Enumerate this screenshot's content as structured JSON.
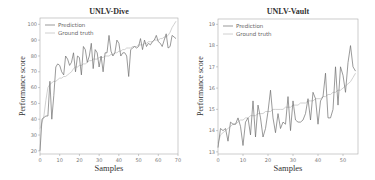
{
  "chart_data": [
    {
      "type": "line",
      "title": "UNLV-Dive",
      "xlabel": "Samples",
      "ylabel": "Performance score",
      "xlim": [
        0,
        70
      ],
      "ylim": [
        18,
        104
      ],
      "xticks": [
        0,
        10,
        20,
        30,
        40,
        50,
        60,
        70
      ],
      "yticks": [
        20,
        30,
        40,
        50,
        60,
        70,
        80,
        90,
        100
      ],
      "legend": {
        "position": "upper left",
        "entries": [
          "Prediction",
          "Ground truth"
        ]
      },
      "grid": false,
      "colors": {
        "prediction": "#6e6e6e",
        "ground_truth": "#c4c4c4"
      },
      "x": [
        0,
        1,
        2,
        3,
        4,
        5,
        6,
        7,
        8,
        9,
        10,
        11,
        12,
        13,
        14,
        15,
        16,
        17,
        18,
        19,
        20,
        21,
        22,
        23,
        24,
        25,
        26,
        27,
        28,
        29,
        30,
        31,
        32,
        33,
        34,
        35,
        36,
        37,
        38,
        39,
        40,
        41,
        42,
        43,
        44,
        45,
        46,
        47,
        48,
        49,
        50,
        51,
        52,
        53,
        54,
        55,
        56,
        57,
        58,
        59,
        60,
        61,
        62,
        63,
        64,
        65,
        66,
        67,
        68,
        69
      ],
      "series": [
        {
          "name": "Prediction",
          "values": [
            20,
            40,
            41,
            42,
            42,
            64,
            40,
            55,
            73,
            75,
            74,
            70,
            68,
            80,
            78,
            74,
            76,
            82,
            70,
            80,
            79,
            68,
            86,
            84,
            76,
            80,
            88,
            72,
            84,
            82,
            73,
            80,
            70,
            82,
            82,
            93,
            83,
            80,
            82,
            90,
            88,
            80,
            82,
            82,
            80,
            67,
            84,
            85,
            86,
            85,
            86,
            91,
            84,
            90,
            86,
            88,
            87,
            89,
            90,
            93,
            89,
            88,
            86,
            90,
            94,
            85,
            86,
            93,
            92,
            91
          ]
        },
        {
          "name": "Ground truth",
          "values": [
            34,
            38,
            42,
            52,
            60,
            62,
            63,
            64,
            64,
            65,
            66,
            66,
            67,
            67,
            68,
            69,
            70,
            72,
            73,
            73,
            74,
            74,
            75,
            75,
            76,
            77,
            77,
            78,
            78,
            78,
            79,
            79,
            79,
            80,
            80,
            80,
            81,
            81,
            82,
            82,
            83,
            83,
            84,
            84,
            85,
            85,
            85,
            86,
            86,
            86,
            87,
            87,
            87,
            88,
            88,
            89,
            89,
            89,
            90,
            90,
            90,
            91,
            91,
            92,
            92,
            93,
            95,
            98,
            100,
            102
          ]
        }
      ]
    },
    {
      "type": "line",
      "title": "UNLV-Vault",
      "xlabel": "Samples",
      "ylabel": "Performance score",
      "xlim": [
        0,
        56
      ],
      "ylim": [
        12.9,
        19.25
      ],
      "xticks": [
        0,
        10,
        20,
        30,
        40,
        50
      ],
      "yticks": [
        13,
        14,
        15,
        16,
        17,
        18,
        19
      ],
      "legend": {
        "position": "upper left",
        "entries": [
          "Prediction",
          "Ground truth"
        ]
      },
      "grid": false,
      "colors": {
        "prediction": "#6e6e6e",
        "ground_truth": "#c4c4c4"
      },
      "x": [
        0,
        1,
        2,
        3,
        4,
        5,
        6,
        7,
        8,
        9,
        10,
        11,
        12,
        13,
        14,
        15,
        16,
        17,
        18,
        19,
        20,
        21,
        22,
        23,
        24,
        25,
        26,
        27,
        28,
        29,
        30,
        31,
        32,
        33,
        34,
        35,
        36,
        37,
        38,
        39,
        40,
        41,
        42,
        43,
        44,
        45,
        46,
        47,
        48,
        49,
        50,
        51,
        52,
        53,
        54,
        55
      ],
      "series": [
        {
          "name": "Prediction",
          "values": [
            13.2,
            14.1,
            14.0,
            14.1,
            13.5,
            14.4,
            14.3,
            14.3,
            14.6,
            14.2,
            13.3,
            14.4,
            14.6,
            13.8,
            15.4,
            13.7,
            15.2,
            14.6,
            13.7,
            14.1,
            14.9,
            15.9,
            14.6,
            13.9,
            14.8,
            14.1,
            14.4,
            14.3,
            15.6,
            14.0,
            15.4,
            14.5,
            14.4,
            14.4,
            14.5,
            14.8,
            15.5,
            14.5,
            15.8,
            15.5,
            14.3,
            15.4,
            15.6,
            16.7,
            14.6,
            14.6,
            15.0,
            17.0,
            15.2,
            17.0,
            16.6,
            15.8,
            17.2,
            18.0,
            17.0,
            16.8
          ]
        },
        {
          "name": "Ground truth",
          "values": [
            13.4,
            13.8,
            13.9,
            14.0,
            14.1,
            14.2,
            14.3,
            14.3,
            14.4,
            14.5,
            14.5,
            14.6,
            14.6,
            14.7,
            14.7,
            14.7,
            14.8,
            14.8,
            14.8,
            14.9,
            14.9,
            14.9,
            15.0,
            15.0,
            15.0,
            15.0,
            15.0,
            15.1,
            15.1,
            15.1,
            15.2,
            15.2,
            15.2,
            15.3,
            15.3,
            15.3,
            15.4,
            15.4,
            15.4,
            15.5,
            15.5,
            15.5,
            15.6,
            15.6,
            15.7,
            15.7,
            15.8,
            15.8,
            15.9,
            15.9,
            16.0,
            16.1,
            16.2,
            16.3,
            16.5,
            16.7
          ]
        }
      ]
    }
  ]
}
